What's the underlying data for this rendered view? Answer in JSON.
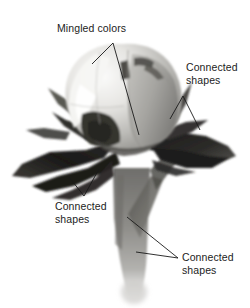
{
  "figure": {
    "background_color": "#ffffff",
    "text_color": "#1c1c1c",
    "leader_line_color": "#1a1a1a"
  },
  "annotations": [
    {
      "id": "mingled-colors",
      "text": "Mingled colors",
      "position": "top-center"
    },
    {
      "id": "connected-shapes-right",
      "text": "Connected\nshapes",
      "position": "upper-right"
    },
    {
      "id": "connected-shapes-left",
      "text": "Connected\nshapes",
      "position": "lower-left"
    },
    {
      "id": "connected-shapes-bottom",
      "text": "Connected\nshapes",
      "position": "bottom-right"
    }
  ],
  "artwork": {
    "palette": {
      "highlight": "#f2f1ef",
      "petal_light": "#dcdbd7",
      "petal_mid": "#a9a8a4",
      "petal_shadow": "#6e6d6a",
      "petal_dark": "#3f3e3c",
      "sepal_dark": "#232221",
      "sepal_black": "#121111",
      "stem_mid": "#8d8c88",
      "stem_dark": "#5a5956",
      "stem_fade": "#c9c8c5"
    }
  }
}
